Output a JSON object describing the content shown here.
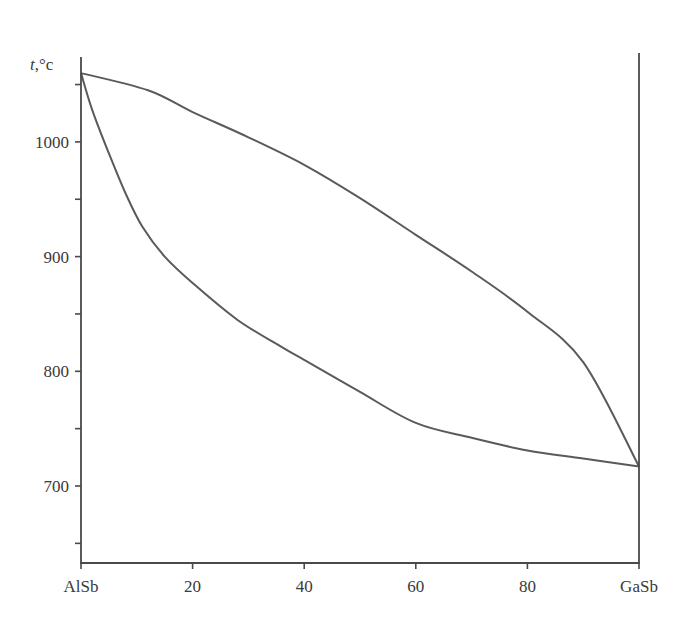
{
  "chart_data": {
    "type": "line",
    "title": "",
    "xlabel": "",
    "ylabel": "t,°c",
    "ylabel_italic_part": "t",
    "ylabel_rest": ",°c",
    "xlim": [
      0,
      100
    ],
    "ylim": [
      650,
      1080
    ],
    "x_ticks": [
      {
        "value": 0,
        "label": "AlSb"
      },
      {
        "value": 20,
        "label": "20"
      },
      {
        "value": 40,
        "label": "40"
      },
      {
        "value": 60,
        "label": "60"
      },
      {
        "value": 80,
        "label": "80"
      },
      {
        "value": 100,
        "label": "GaSb"
      }
    ],
    "y_ticks": [
      {
        "value": 650,
        "label": ""
      },
      {
        "value": 700,
        "label": "700"
      },
      {
        "value": 750,
        "label": ""
      },
      {
        "value": 800,
        "label": "800"
      },
      {
        "value": 850,
        "label": ""
      },
      {
        "value": 900,
        "label": "900"
      },
      {
        "value": 950,
        "label": ""
      },
      {
        "value": 1000,
        "label": "1000"
      },
      {
        "value": 1050,
        "label": ""
      }
    ],
    "grid": false,
    "legend": null,
    "series": [
      {
        "name": "liquidus",
        "x": [
          0,
          12,
          20,
          30,
          40,
          50,
          60,
          70,
          80,
          90,
          100
        ],
        "values": [
          1060,
          1045,
          1026,
          1004,
          980,
          951,
          919,
          887,
          852,
          808,
          717
        ]
      },
      {
        "name": "solidus",
        "x": [
          0,
          2,
          5,
          8,
          11,
          15,
          20,
          28,
          36,
          40,
          50,
          60,
          70,
          80,
          90,
          100
        ],
        "values": [
          1060,
          1028,
          990,
          955,
          926,
          900,
          877,
          845,
          821,
          810,
          782,
          755,
          742,
          731,
          724,
          717
        ]
      }
    ],
    "colors": {
      "axis": "#4a4a4a",
      "curve": "#5a5a5a",
      "text": "#3a3a3a"
    }
  }
}
